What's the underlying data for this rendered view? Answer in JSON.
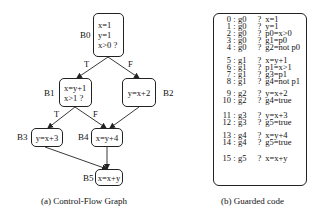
{
  "cfg": {
    "caption": "(a)  Control-Flow Graph",
    "blocks": [
      {
        "id": "B0",
        "label": "B0",
        "lines": [
          "x=1",
          "y=1",
          "x>0 ?"
        ]
      },
      {
        "id": "B1",
        "label": "B1",
        "lines": [
          "x=y+1",
          "x>1 ?"
        ]
      },
      {
        "id": "B2",
        "label": "B2",
        "lines": [
          "y=x+2"
        ]
      },
      {
        "id": "B3",
        "label": "B3",
        "lines": [
          "y=x+3"
        ]
      },
      {
        "id": "B4",
        "label": "B4",
        "lines": [
          "x=y+4"
        ]
      },
      {
        "id": "B5",
        "label": "B5",
        "lines": [
          "x=x+y"
        ]
      }
    ],
    "edges": [
      {
        "from": "B0",
        "to": "B1",
        "label": "T"
      },
      {
        "from": "B0",
        "to": "B2",
        "label": "F"
      },
      {
        "from": "B1",
        "to": "B3",
        "label": "T"
      },
      {
        "from": "B1",
        "to": "B4",
        "label": "F"
      },
      {
        "from": "B2",
        "to": "B4",
        "label": ""
      },
      {
        "from": "B3",
        "to": "B5",
        "label": ""
      },
      {
        "from": "B4",
        "to": "B5",
        "label": ""
      }
    ]
  },
  "guarded": {
    "caption": "(b)  Guarded code",
    "lines": [
      {
        "num": "0",
        "guard": "g0",
        "instr": "x=1"
      },
      {
        "num": "1",
        "guard": "g0",
        "instr": "y=1"
      },
      {
        "num": "2",
        "guard": "g0",
        "instr": "p0=x>0"
      },
      {
        "num": "3",
        "guard": "g0",
        "instr": "g1=p0"
      },
      {
        "num": "4",
        "guard": "g0",
        "instr": "g2=not p0"
      },
      {
        "num": "5",
        "guard": "g1",
        "instr": "x=y+1"
      },
      {
        "num": "6",
        "guard": "g1",
        "instr": "p1=x>1"
      },
      {
        "num": "7",
        "guard": "g1",
        "instr": "g3=p1"
      },
      {
        "num": "8",
        "guard": "g1",
        "instr": "g4=not p1"
      },
      {
        "num": "9",
        "guard": "g2",
        "instr": "y=x+2"
      },
      {
        "num": "10",
        "guard": "g2",
        "instr": "g4=true"
      },
      {
        "num": "11",
        "guard": "g3",
        "instr": "y=x+3"
      },
      {
        "num": "12",
        "guard": "g3",
        "instr": "g5=true"
      },
      {
        "num": "13",
        "guard": "g4",
        "instr": "x=y+4"
      },
      {
        "num": "14",
        "guard": "g4",
        "instr": "g5=true"
      },
      {
        "num": "15",
        "guard": "g5",
        "instr": "x=x+y"
      }
    ],
    "separator": ":",
    "question": "?"
  }
}
